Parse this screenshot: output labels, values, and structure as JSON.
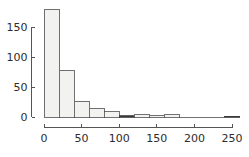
{
  "chart_data": {
    "type": "bar",
    "subtype": "histogram",
    "title": "",
    "subtitle": "",
    "xlabel": "",
    "ylabel": "",
    "bin_width": 20,
    "bin_starts": [
      0,
      20,
      40,
      60,
      80,
      100,
      120,
      140,
      160,
      180,
      200,
      220,
      240
    ],
    "bin_ends": [
      20,
      40,
      60,
      80,
      100,
      120,
      140,
      160,
      180,
      200,
      220,
      240,
      260
    ],
    "categories": [
      "0-20",
      "20-40",
      "40-60",
      "60-80",
      "80-100",
      "100-120",
      "120-140",
      "140-160",
      "160-180",
      "180-200",
      "200-220",
      "220-240",
      "240-260"
    ],
    "values": [
      180,
      78,
      26,
      15,
      9,
      2,
      4,
      3,
      4,
      0,
      0,
      0,
      1
    ],
    "xlim": [
      0,
      277
    ],
    "ylim": [
      0,
      188
    ],
    "xticks": [
      0,
      50,
      100,
      150,
      200,
      250
    ],
    "xtick_labels": [
      "0",
      "50",
      "100",
      "150",
      "200",
      "250"
    ],
    "yticks": [
      0,
      50,
      100,
      150
    ],
    "ytick_labels": [
      "0",
      "50",
      "100",
      "150"
    ],
    "grid": false,
    "legend": false,
    "legend_position": "none",
    "bar_fill_color": "#f2f2f0",
    "bar_edge_color": "#4d4d4d",
    "axis_color": "#555555",
    "text_color": "#2b2b2b",
    "background_color": "#ffffff"
  }
}
